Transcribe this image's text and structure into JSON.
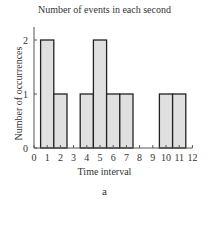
{
  "chart_data": {
    "type": "bar",
    "title": "Number of events in each second",
    "xlabel": "Time interval",
    "ylabel": "Number of occurrences",
    "panel_label": "a",
    "categories": [
      "0",
      "1",
      "2",
      "3",
      "4",
      "5",
      "6",
      "7",
      "8",
      "9",
      "10",
      "11",
      "12"
    ],
    "values": [
      0,
      2,
      1,
      0,
      1,
      2,
      1,
      1,
      0,
      0,
      1,
      1,
      0
    ],
    "xlim": [
      0,
      12
    ],
    "ylim": [
      0,
      2
    ],
    "yticks": [
      "0",
      "1",
      "2"
    ],
    "grid": false,
    "bar_color": "#e0e0e0",
    "edge_color": "#222222"
  }
}
